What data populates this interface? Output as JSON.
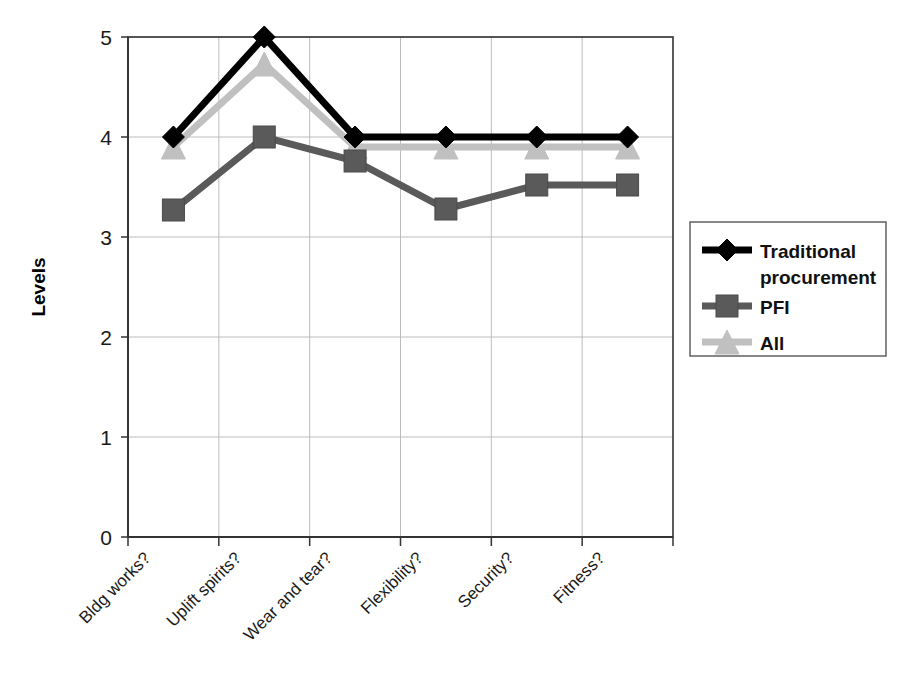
{
  "chart_data": {
    "type": "line",
    "title": "",
    "xlabel": "",
    "ylabel": "Levels",
    "ylim": [
      0,
      5
    ],
    "yticks": [
      0,
      1,
      2,
      3,
      4,
      5
    ],
    "grid": true,
    "legend_position": "right",
    "categories": [
      "Bldg works?",
      "Uplift spirits?",
      "Wear and tear?",
      "Flexibility?",
      "Security?",
      "Fitness?"
    ],
    "series": [
      {
        "name": "Traditional procurement",
        "color": "#000000",
        "marker": "diamond",
        "values": [
          4.0,
          5.0,
          4.0,
          4.0,
          4.0,
          4.0
        ]
      },
      {
        "name": "PFI",
        "color": "#5a5a5a",
        "marker": "square",
        "values": [
          3.27,
          4.0,
          3.76,
          3.28,
          3.52,
          3.52
        ]
      },
      {
        "name": "All",
        "color": "#c0c0c0",
        "marker": "triangle",
        "values": [
          3.9,
          4.73,
          3.9,
          3.9,
          3.9,
          3.9
        ]
      }
    ]
  },
  "axis": {
    "y_tick_labels": [
      "0",
      "1",
      "2",
      "3",
      "4",
      "5"
    ],
    "y_title": "Levels"
  },
  "legend": {
    "entries": [
      {
        "label_line1": "Traditional",
        "label_line2": "procurement",
        "marker": "diamond",
        "color": "#000000"
      },
      {
        "label_line1": "PFI",
        "label_line2": "",
        "marker": "square",
        "color": "#5a5a5a"
      },
      {
        "label_line1": "All",
        "label_line2": "",
        "marker": "triangle",
        "color": "#c0c0c0"
      }
    ]
  },
  "colors": {
    "traditional": "#000000",
    "pfi": "#5a5a5a",
    "all": "#c0c0c0",
    "grid": "#bdbdbd",
    "axis": "#333333",
    "background": "#ffffff"
  }
}
